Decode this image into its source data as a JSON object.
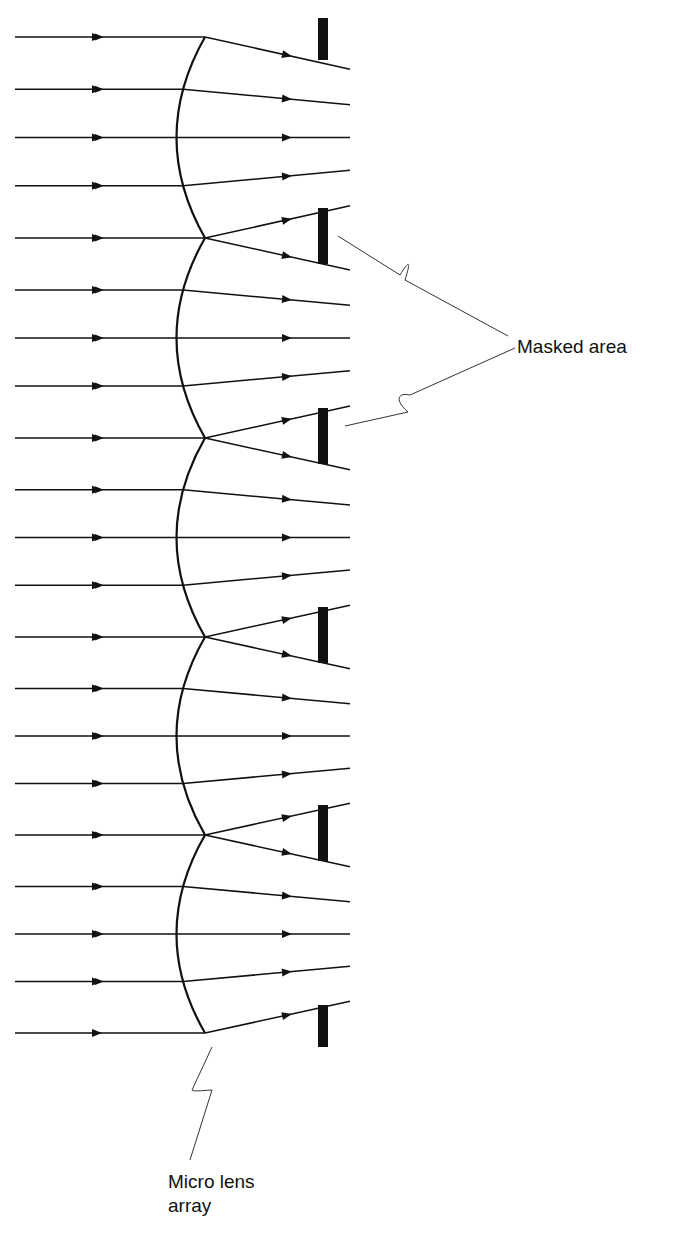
{
  "diagram": {
    "labels": {
      "masked_area": "Masked area",
      "micro_lens_array_line1": "Micro lens",
      "micro_lens_array_line2": "array"
    },
    "colors": {
      "ink": "#111111",
      "background": "#ffffff"
    },
    "lens_junctions_y": [
      37,
      238,
      438,
      637,
      835,
      1033
    ],
    "lens_junction_x": 205,
    "lens_bulge_x": 175,
    "mask_x": 318,
    "mask_width": 10,
    "rays_per_lens": 5,
    "ray_exit_x": 350
  }
}
